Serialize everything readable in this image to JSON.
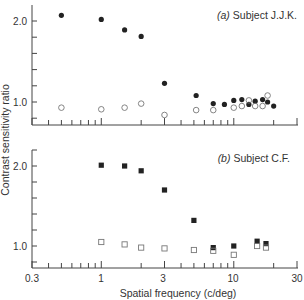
{
  "chart_data": [
    {
      "type": "scatter",
      "panel": "a",
      "title": "(a) Subject J.J.K.",
      "title_prefix": "(a)",
      "title_text": "Subject J.J.K.",
      "xlabel": "Spatial frequency (c/deg)",
      "ylabel": "Contrast sensitivity ratio",
      "xscale": "log",
      "xlim": [
        0.3,
        30
      ],
      "ylim": [
        0.75,
        2.2
      ],
      "yticks": [
        "1.0",
        "2.0"
      ],
      "series": [
        {
          "name": "filled circles",
          "marker": "filled-circle",
          "x": [
            0.5,
            1.0,
            1.5,
            2.0,
            3.0,
            5.2,
            7.0,
            8.5,
            10.0,
            11.5,
            13.0,
            14.5,
            16.5,
            18.0,
            20.0
          ],
          "y": [
            2.07,
            2.02,
            1.89,
            1.81,
            1.23,
            1.08,
            0.98,
            0.97,
            1.02,
            1.03,
            0.97,
            1.01,
            1.03,
            1.0,
            0.95
          ]
        },
        {
          "name": "open circles",
          "marker": "open-circle",
          "x": [
            0.5,
            1.0,
            1.5,
            2.0,
            3.0,
            5.2,
            7.0,
            10.0,
            11.5,
            13.0,
            14.5,
            16.5,
            18.0
          ],
          "y": [
            0.93,
            0.91,
            0.93,
            0.98,
            0.84,
            0.9,
            0.9,
            0.93,
            0.95,
            1.02,
            0.95,
            0.95,
            1.08
          ]
        }
      ]
    },
    {
      "type": "scatter",
      "panel": "b",
      "title": "(b) Subject C.F.",
      "title_prefix": "(b)",
      "title_text": "Subject C.F.",
      "xlabel": "Spatial frequency (c/deg)",
      "ylabel": "Contrast sensitivity ratio",
      "xscale": "log",
      "xlim": [
        0.3,
        30
      ],
      "ylim": [
        0.75,
        2.2
      ],
      "xticks": [
        "0.3",
        "1",
        "3",
        "10",
        "30"
      ],
      "yticks": [
        "1.0",
        "2.0"
      ],
      "series": [
        {
          "name": "filled squares",
          "marker": "filled-square",
          "x": [
            1.0,
            1.5,
            2.0,
            3.0,
            5.0,
            7.0,
            10.0,
            15.0,
            17.5
          ],
          "y": [
            2.01,
            2.0,
            1.94,
            1.7,
            1.32,
            0.98,
            1.0,
            1.06,
            1.03
          ]
        },
        {
          "name": "open squares",
          "marker": "open-square",
          "x": [
            1.0,
            1.5,
            2.0,
            3.0,
            5.0,
            7.0,
            10.0,
            15.0,
            17.5
          ],
          "y": [
            1.05,
            1.02,
            0.98,
            0.97,
            0.95,
            0.94,
            0.89,
            1.0,
            0.98
          ]
        }
      ]
    }
  ],
  "labels": {
    "ylabel": "Contrast sensitivity ratio",
    "xlabel": "Spatial frequency (c/deg)",
    "panel_a_prefix": "(a)",
    "panel_a_text": " Subject J.J.K.",
    "panel_b_prefix": "(b)",
    "panel_b_text": " Subject C.F.",
    "ytick_2": "2.0",
    "ytick_1": "1.0",
    "xtick_03": "0.3",
    "xtick_1": "1",
    "xtick_3": "3",
    "xtick_10": "10",
    "xtick_30": "30"
  },
  "colors": {
    "ink": "#222222",
    "axis": "#444444",
    "open_marker": "#777777"
  }
}
